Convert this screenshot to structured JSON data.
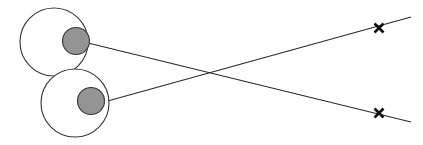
{
  "figure": {
    "title": "Two eyes with crossed gaze lines toward X targets",
    "background_color": "#ffffff",
    "width": 423,
    "height": 145
  },
  "colors": {
    "outline_stroke": "#3a3a3a",
    "pupil_fill": "#949494",
    "line_stroke": "#2b2b2b",
    "x_mark_stroke": "#111111",
    "background": "#ffffff"
  },
  "eyes": [
    {
      "name": "upper-eye",
      "label": "Upper eye",
      "cx": 54,
      "cy": 42,
      "r": 34,
      "pupil": {
        "name": "upper-pupil",
        "label": "Upper pupil",
        "cx": 76,
        "cy": 41,
        "r": 13.5
      }
    },
    {
      "name": "lower-eye",
      "label": "Lower eye",
      "cx": 75,
      "cy": 103,
      "r": 34,
      "pupil": {
        "name": "lower-pupil",
        "label": "Lower pupil",
        "cx": 91,
        "cy": 101,
        "r": 13.5
      }
    }
  ],
  "gaze_lines": [
    {
      "name": "upper-eye-gaze-line",
      "label": "Gaze line from upper eye to lower X target",
      "x1": 88,
      "y1": 43,
      "x2": 411,
      "y2": 122
    },
    {
      "name": "lower-eye-gaze-line",
      "label": "Gaze line from lower eye to upper X target",
      "x1": 104,
      "y1": 102,
      "x2": 411,
      "y2": 17
    }
  ],
  "crossing_point": {
    "name": "gaze-crossing-point",
    "label": "Gaze lines crossing point",
    "x": 213,
    "y": 72
  },
  "targets": [
    {
      "name": "upper-x-target",
      "label": "X",
      "cx": 379,
      "cy": 28,
      "size": 9
    },
    {
      "name": "lower-x-target",
      "label": "X",
      "cx": 379,
      "cy": 113,
      "size": 9
    }
  ]
}
